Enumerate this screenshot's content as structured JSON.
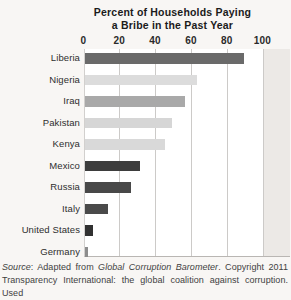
{
  "figure": {
    "title_line1": "Percent of Households Paying",
    "title_line2": "a Bribe in the Past Year"
  },
  "chart_data": {
    "type": "bar",
    "orientation": "horizontal",
    "title": "Percent of Households Paying a Bribe in the Past Year",
    "categories": [
      "Liberia",
      "Nigeria",
      "Iraq",
      "Pakistan",
      "Kenya",
      "Mexico",
      "Russia",
      "Italy",
      "United States",
      "Germany"
    ],
    "values": [
      89,
      63,
      56,
      49,
      45,
      31,
      26,
      13,
      5,
      2
    ],
    "bar_colors": [
      "#6a6a6a",
      "#dcdcdc",
      "#a9a9a9",
      "#d6d6d6",
      "#d9d9d9",
      "#3d3d3d",
      "#484848",
      "#4a4a4a",
      "#313131",
      "#8d8d8d"
    ],
    "xlabel": "",
    "ylabel": "",
    "xlim": [
      0,
      100
    ],
    "x_ticks": [
      0,
      20,
      40,
      60,
      80,
      100
    ],
    "grid": true,
    "legend": false
  },
  "source": {
    "lines": [
      [
        {
          "t": "Source",
          "i": true
        },
        {
          "t": ": Adapted from ",
          "i": false
        },
        {
          "t": "Global Corruption Barometer",
          "i": true
        },
        {
          "t": ". Copyright 2011",
          "i": false
        }
      ],
      [
        {
          "t": "Transparency International: the global coalition against corruption. Used",
          "i": false
        }
      ]
    ]
  },
  "colors": {
    "page_background": "#f8f6f4",
    "plot_background": "#ffffff",
    "outside_plot_strip": "#ece9e6",
    "gridline": "#cccac8",
    "axis_line": "#b9b6b3",
    "title_text": "#1b1b1b",
    "label_text": "#2e2e2e",
    "source_text": "#3f3f3f"
  }
}
